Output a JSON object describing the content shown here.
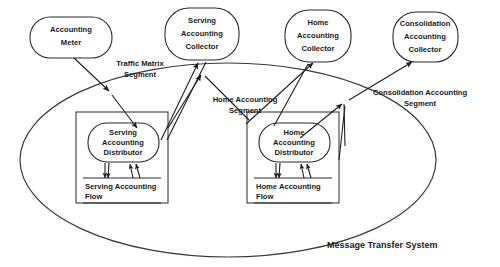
{
  "diagram": {
    "system_label": "Message Transfer System",
    "colors": {
      "stroke": "#2b2b2b",
      "text": "#1a1a1a",
      "background": "#ffffff"
    },
    "external_nodes": [
      {
        "id": "accounting-meter",
        "lines": [
          "Accounting",
          "Meter"
        ]
      },
      {
        "id": "serving-accounting-collector",
        "lines": [
          "Serving",
          "Accounting",
          "Collector"
        ]
      },
      {
        "id": "home-accounting-collector",
        "lines": [
          "Home",
          "Accounting",
          "Collector"
        ]
      },
      {
        "id": "consolidation-accounting-collector",
        "lines": [
          "Consolidation",
          "Accounting",
          "Collector"
        ]
      }
    ],
    "segment_labels": [
      {
        "id": "traffic-matrix-segment",
        "lines": [
          "Traffic Matrix",
          "Segment"
        ]
      },
      {
        "id": "home-accounting-segment",
        "lines": [
          "Home Accounting",
          "Segment"
        ]
      },
      {
        "id": "consolidation-accounting-segment",
        "lines": [
          "Consolidation Accounting",
          "Segment"
        ]
      }
    ],
    "internal_groups": [
      {
        "id": "serving-group",
        "distributor": {
          "lines": [
            "Serving",
            "Accounting",
            "Distributor"
          ]
        },
        "flow": {
          "lines": [
            "Serving Accounting",
            "Flow"
          ]
        }
      },
      {
        "id": "home-group",
        "distributor": {
          "lines": [
            "Home",
            "Accounting",
            "Distributor"
          ]
        },
        "flow": {
          "lines": [
            "Home Accounting",
            "Flow"
          ]
        }
      }
    ]
  }
}
